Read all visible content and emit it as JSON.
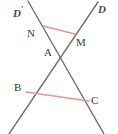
{
  "figure": {
    "width": 118,
    "height": 134,
    "background": "#ffffff"
  },
  "colors": {
    "line_stroke": "#6f6f6f",
    "segment_stroke": "#e8988a",
    "label_text": "#3a3a3a",
    "line_label_text": "#4a4a4a"
  },
  "lines": [
    {
      "id": "line-d-prime",
      "name": "line-d-prime",
      "label": "D",
      "prime": "′",
      "label_position": "top-left",
      "x1": 28,
      "y1": 1,
      "x2": 104,
      "y2": 134,
      "stroke": "#6f6f6f",
      "stroke_width": 1.4
    },
    {
      "id": "line-d",
      "name": "line-d",
      "label": "D",
      "prime": "",
      "label_position": "top-right",
      "x1": 98,
      "y1": 2,
      "x2": 9,
      "y2": 134,
      "stroke": "#6f6f6f",
      "stroke_width": 1.4
    }
  ],
  "segments": [
    {
      "id": "segment-NM",
      "name": "segment-nm",
      "from": "N",
      "to": "M",
      "x1": 43,
      "y1": 26,
      "x2": 75,
      "y2": 34,
      "stroke": "#e8988a",
      "stroke_width": 1.3
    },
    {
      "id": "segment-BC",
      "name": "segment-bc",
      "from": "B",
      "to": "C",
      "x1": 26,
      "y1": 92,
      "x2": 89,
      "y2": 101,
      "stroke": "#e8988a",
      "stroke_width": 1.3
    }
  ],
  "points": [
    {
      "id": "point-N",
      "label": "N",
      "x": 43,
      "y": 26,
      "on": "line-d-prime"
    },
    {
      "id": "point-M",
      "label": "M",
      "x": 75,
      "y": 34,
      "on": "line-d"
    },
    {
      "id": "point-A",
      "label": "A",
      "x": 58,
      "y": 55,
      "on": "intersection"
    },
    {
      "id": "point-B",
      "label": "B",
      "x": 26,
      "y": 92,
      "on": "line-d"
    },
    {
      "id": "point-C",
      "label": "C",
      "x": 89,
      "y": 101,
      "on": "line-d-prime"
    }
  ],
  "labels": {
    "N": "N",
    "M": "M",
    "A": "A",
    "B": "B",
    "C": "C",
    "D_prime": "D",
    "D_prime_mark": "′",
    "D": "D"
  }
}
